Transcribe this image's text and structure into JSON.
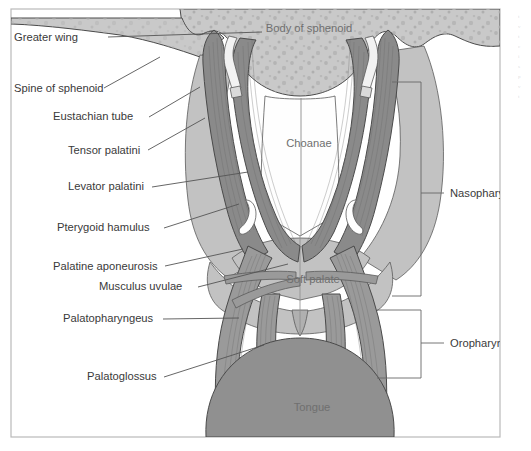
{
  "figure": {
    "frame_border_color": "#b9b9b9",
    "background_color": "#ffffff"
  },
  "palette": {
    "bone_sphenoid": "#c9c9c9",
    "bone_speckle": "#b0b0b0",
    "muscle_dark": "#8a8a8a",
    "muscle_mid": "#9a9a9a",
    "soft_tissue_light": "#c2c2c2",
    "tongue": "#909090",
    "airway_white": "#fefefe",
    "eustachian_tube": "#f2f2f2",
    "label_text": "#3a3a3a",
    "inner_label_text": "#6f6f6f",
    "leader_line": "#555555"
  },
  "labels_left": [
    {
      "id": "greater-wing",
      "text": "Greater wing",
      "x": 14,
      "y": 41,
      "anchor_x": 108,
      "anchor_y": 37,
      "tip_x": 262,
      "tip_y": 32
    },
    {
      "id": "spine-of-sphenoid",
      "text": "Spine of sphenoid",
      "x": 14,
      "y": 92,
      "anchor_x": 104,
      "anchor_y": 88,
      "tip_x": 160,
      "tip_y": 57
    },
    {
      "id": "eustachian-tube",
      "text": "Eustachian tube",
      "x": 53,
      "y": 120,
      "anchor_x": 149,
      "anchor_y": 117,
      "tip_x": 200,
      "tip_y": 87
    },
    {
      "id": "tensor-palatini",
      "text": "Tensor palatini",
      "x": 68,
      "y": 154,
      "anchor_x": 148,
      "anchor_y": 150,
      "tip_x": 205,
      "tip_y": 118
    },
    {
      "id": "levator-palatini",
      "text": "Levator palatini",
      "x": 68,
      "y": 190,
      "anchor_x": 152,
      "anchor_y": 187,
      "tip_x": 248,
      "tip_y": 172
    },
    {
      "id": "pterygoid-hamulus",
      "text": "Pterygoid hamulus",
      "x": 57,
      "y": 231,
      "anchor_x": 164,
      "anchor_y": 228,
      "tip_x": 239,
      "tip_y": 204
    },
    {
      "id": "palatine-aponeurosis",
      "text": "Palatine aponeurosis",
      "x": 53,
      "y": 270,
      "anchor_x": 165,
      "anchor_y": 266,
      "tip_x": 243,
      "tip_y": 249
    },
    {
      "id": "musculus-uvulae",
      "text": "Musculus uvulae",
      "x": 99,
      "y": 290,
      "anchor_x": 198,
      "anchor_y": 287,
      "tip_x": 288,
      "tip_y": 264
    },
    {
      "id": "palatopharyngeus",
      "text": "Palatopharyngeus",
      "x": 63,
      "y": 322,
      "anchor_x": 163,
      "anchor_y": 319,
      "tip_x": 239,
      "tip_y": 318
    },
    {
      "id": "palatoglossus",
      "text": "Palatoglossus",
      "x": 87,
      "y": 380,
      "anchor_x": 164,
      "anchor_y": 377,
      "tip_x": 264,
      "tip_y": 345
    }
  ],
  "labels_right": [
    {
      "id": "nasopharynx",
      "text": "Nasopharynx",
      "x": 450,
      "y": 197,
      "bracket_x": 421,
      "bracket_top": 82,
      "bracket_bottom": 296,
      "stub_x_end": 444,
      "stub_y": 193,
      "arm_x": 392
    },
    {
      "id": "oropharynx",
      "text": "Oropharynx",
      "x": 450,
      "y": 343,
      "bracket_x": 421,
      "bracket_top": 310,
      "bracket_bottom": 378,
      "stub_x_end": 444,
      "stub_y": 343,
      "arm_x": 377
    }
  ],
  "labels_inner": [
    {
      "id": "body-of-sphenoid",
      "text": "Body of sphenoid",
      "x": 309,
      "y": 32
    },
    {
      "id": "choanae",
      "text": "Choanae",
      "x": 309,
      "y": 147
    },
    {
      "id": "soft-palate",
      "text": "Soft palate",
      "x": 313,
      "y": 283
    },
    {
      "id": "tongue",
      "text": "Tongue",
      "x": 312,
      "y": 411
    }
  ],
  "edge_fragment": {
    "id": "page-edge-text",
    "lines": [
      "t",
      "v",
      "t",
      "c",
      "i",
      "s",
      "p",
      "v",
      "t"
    ]
  }
}
